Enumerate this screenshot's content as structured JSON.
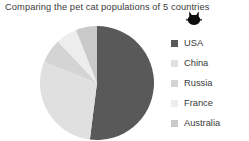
{
  "chart_data": {
    "type": "pie",
    "title": "Comparing the pet cat populations of 5 countries",
    "categories": [
      "USA",
      "China",
      "Russia",
      "France",
      "Australia"
    ],
    "values": [
      52,
      29,
      7,
      6,
      6
    ],
    "colors": [
      "#595959",
      "#e0e0e0",
      "#d4d4d4",
      "#ededed",
      "#c9c9c9"
    ],
    "start_angle": 0,
    "direction": "clockwise",
    "legend_position": "right",
    "grid": false,
    "xlabel": "",
    "ylabel": ""
  },
  "icons": {
    "cat": "cat-silhouette-icon"
  },
  "geometry": {
    "cx": 59,
    "cy": 58,
    "r": 57
  }
}
